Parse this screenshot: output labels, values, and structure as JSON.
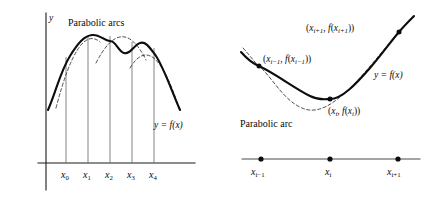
{
  "figure": {
    "type": "math-diagram",
    "background_color": "#ffffff",
    "ink_color": "#0b0b0b"
  },
  "left_panel": {
    "title": "Parabolic arcs",
    "y_axis_label": "y",
    "function_label": {
      "y": "y",
      "equals": "=",
      "f": "f",
      "arg": "(x)",
      "full": "y = f(x)"
    },
    "tick_labels": [
      {
        "base": "x",
        "sub": "0",
        "full": "x0",
        "x": 66
      },
      {
        "base": "x",
        "sub": "1",
        "full": "x1",
        "x": 88
      },
      {
        "base": "x",
        "sub": "2",
        "full": "x2",
        "x": 110
      },
      {
        "base": "x",
        "sub": "3",
        "full": "x3",
        "x": 132
      },
      {
        "base": "x",
        "sub": "4",
        "full": "x4",
        "x": 154
      }
    ],
    "ordinate_x_positions": [
      66,
      88,
      110,
      132,
      154
    ],
    "axis": {
      "y_axis_x": 46,
      "y_axis_top": 13,
      "y_axis_bottom": 190,
      "x_axis_y": 163,
      "x_axis_left": 38,
      "x_axis_right": 195
    }
  },
  "right_panel": {
    "arc_label": "Parabolic arc",
    "function_label": {
      "full": "y = f(x)"
    },
    "point_labels": [
      {
        "name": "point-i-minus-1",
        "text": "(x_{i-1}, f(x_{i-1}))",
        "base": "x",
        "sub": "i−1",
        "x": 261,
        "y": 62
      },
      {
        "name": "point-i",
        "text": "(x_i, f(x_i))",
        "base": "x",
        "sub": "i",
        "x": 330,
        "y": 114
      },
      {
        "name": "point-i-plus-1",
        "text": "(x_{i+1}, f(x_{i+1}))",
        "base": "x",
        "sub": "i+1",
        "x": 307,
        "y": 31
      }
    ],
    "curve_points": [
      {
        "x": 259,
        "y": 66
      },
      {
        "x": 330,
        "y": 99
      },
      {
        "x": 399,
        "y": 32
      }
    ],
    "number_line": {
      "left": 242,
      "right": 420,
      "y": 159,
      "ticks": [
        {
          "base": "x",
          "sub": "i−1",
          "full": "xi-1",
          "x": 261
        },
        {
          "base": "x",
          "sub": "i",
          "full": "xi",
          "x": 330
        },
        {
          "base": "x",
          "sub": "i+1",
          "full": "xi+1",
          "x": 398
        }
      ]
    }
  }
}
